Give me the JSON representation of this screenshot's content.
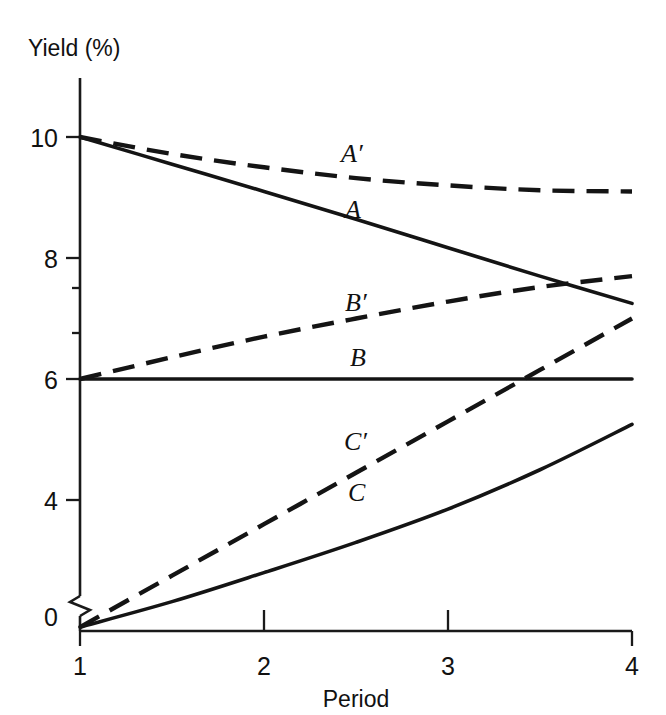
{
  "chart_data": {
    "type": "line",
    "title": "",
    "subtitle": "",
    "xlabel": "Period",
    "ylabel": "Yield (%)",
    "xlim": [
      1,
      4
    ],
    "ylim": [
      0,
      10.6
    ],
    "grid": false,
    "legend": "inline-labels",
    "axis_break": {
      "axis": "y",
      "between": [
        0,
        1.5
      ],
      "note": "zigzag break on y-axis between 0 and lower data range"
    },
    "x_ticks": [
      "1",
      "2",
      "3",
      "4"
    ],
    "x_tick_values": [
      1,
      2,
      3,
      4
    ],
    "y_ticks": [
      "0",
      "4",
      "6",
      "8",
      "10"
    ],
    "y_tick_values": [
      0,
      4,
      6,
      8,
      10
    ],
    "x": [
      1,
      1.5,
      2,
      2.5,
      3,
      3.5,
      4
    ],
    "series": [
      {
        "name": "A",
        "label": "A",
        "style": "solid",
        "values": [
          10.0,
          9.55,
          9.1,
          8.64,
          8.17,
          7.7,
          7.25
        ]
      },
      {
        "name": "A'",
        "label": "A′",
        "style": "dashed",
        "values": [
          10.0,
          9.72,
          9.5,
          9.32,
          9.2,
          9.12,
          9.1
        ]
      },
      {
        "name": "B",
        "label": "B",
        "style": "solid",
        "values": [
          6.0,
          6.0,
          6.0,
          6.0,
          6.0,
          6.0,
          6.0
        ]
      },
      {
        "name": "B'",
        "label": "B′",
        "style": "dashed",
        "values": [
          6.0,
          6.36,
          6.7,
          7.0,
          7.28,
          7.52,
          7.7
        ]
      },
      {
        "name": "C",
        "label": "C",
        "style": "solid",
        "values": [
          1.9,
          2.32,
          2.8,
          3.3,
          3.85,
          4.5,
          5.25
        ]
      },
      {
        "name": "C'",
        "label": "C′",
        "style": "dashed",
        "values": [
          1.9,
          2.75,
          3.6,
          4.45,
          5.3,
          6.15,
          7.0
        ]
      }
    ],
    "annotations": [
      {
        "text": "A′",
        "x": 2.78,
        "y": 9.55
      },
      {
        "text": "A",
        "x": 2.78,
        "y": 8.68
      },
      {
        "text": "B′",
        "x": 2.45,
        "y": 7.06
      },
      {
        "text": "B",
        "x": 2.52,
        "y": 6.33
      },
      {
        "text": "C′",
        "x": 2.45,
        "y": 4.86
      },
      {
        "text": "C",
        "x": 2.48,
        "y": 4.18
      }
    ]
  },
  "colors": {
    "ink": "#141414",
    "background": "#ffffff"
  }
}
